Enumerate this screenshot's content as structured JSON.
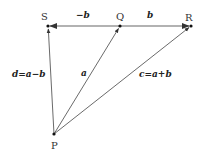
{
  "diagram": {
    "type": "vector-diagram",
    "points": {
      "S": {
        "label": "S",
        "x": 48,
        "y": 26
      },
      "Q": {
        "label": "Q",
        "x": 120,
        "y": 26
      },
      "R": {
        "label": "R",
        "x": 191,
        "y": 26
      },
      "P": {
        "label": "P",
        "x": 54,
        "y": 134
      }
    },
    "vectors": [
      {
        "from": "Q",
        "to": "S",
        "label": "−b"
      },
      {
        "from": "Q",
        "to": "R",
        "label": "b"
      },
      {
        "from": "P",
        "to": "Q",
        "label": "a"
      },
      {
        "from": "P",
        "to": "R",
        "label": "c=a+b"
      },
      {
        "from": "P",
        "to": "S",
        "label": "d=a−b"
      }
    ],
    "colors": {
      "horizontal_line": "#999999",
      "vector_line": "#444444",
      "point": "#111111",
      "text": "#333333"
    }
  }
}
